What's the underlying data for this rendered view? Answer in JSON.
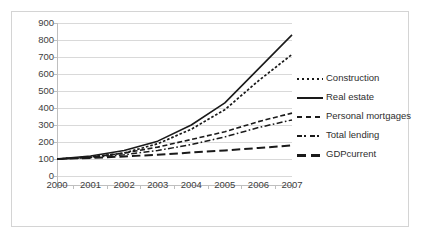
{
  "chart_data": {
    "type": "line",
    "title": "",
    "xlabel": "",
    "ylabel": "",
    "x": [
      "2000",
      "2001",
      "2002",
      "2003",
      "2004",
      "2005",
      "2006",
      "2007"
    ],
    "categories": [
      "2000",
      "2001",
      "2002",
      "2003",
      "2004",
      "2005",
      "2006",
      "2007"
    ],
    "ylim": [
      0,
      900
    ],
    "yticks": [
      0,
      100,
      200,
      300,
      400,
      500,
      600,
      700,
      800,
      900
    ],
    "ytick_labels": [
      "0",
      "100",
      "200",
      "300",
      "400",
      "500",
      "600",
      "700",
      "800",
      "900"
    ],
    "grid": true,
    "grid_axis": "y",
    "legend_position": "right",
    "series": [
      {
        "name": "Construction",
        "style": "dotted",
        "color": "#1a1a1a",
        "values": [
          100,
          112,
          135,
          190,
          275,
          390,
          560,
          715
        ]
      },
      {
        "name": "Real estate",
        "style": "solid",
        "color": "#1a1a1a",
        "values": [
          100,
          118,
          150,
          205,
          300,
          430,
          630,
          830
        ]
      },
      {
        "name": "Personal mortgages",
        "style": "dashed",
        "color": "#1a1a1a",
        "values": [
          100,
          110,
          135,
          170,
          215,
          260,
          320,
          370
        ]
      },
      {
        "name": "Total lending",
        "style": "dash-dot",
        "color": "#1a1a1a",
        "values": [
          100,
          108,
          125,
          150,
          185,
          230,
          285,
          330
        ]
      },
      {
        "name": "GDPcurrent",
        "style": "long-dash",
        "color": "#1a1a1a",
        "values": [
          100,
          106,
          115,
          125,
          138,
          150,
          165,
          180
        ]
      }
    ]
  },
  "legend": {
    "items": [
      {
        "label": "Construction",
        "key": "dotted-line-key"
      },
      {
        "label": "Real estate",
        "key": "solid-line-key"
      },
      {
        "label": "Personal mortgages",
        "key": "dashed-line-key"
      },
      {
        "label": "Total lending",
        "key": "dash-dot-line-key"
      },
      {
        "label": "GDPcurrent",
        "key": "long-dash-line-key"
      }
    ]
  },
  "colors": {
    "line": "#1a1a1a",
    "grid": "#d9d9d9",
    "axis": "#bfbfbf",
    "border": "#d4d4d4",
    "text": "#3d3d3d",
    "background": "#ffffff"
  }
}
